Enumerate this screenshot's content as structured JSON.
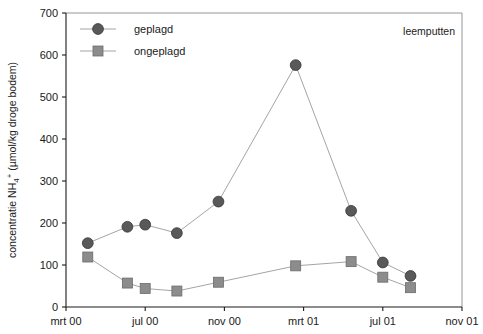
{
  "chart_data": {
    "type": "line",
    "title": "",
    "annotation": "leemputten",
    "xlabel": "",
    "ylabel": "concentratie NH4+ (µmol/kg droge bodem)",
    "ylabel_parts": {
      "prefix": "concentratie NH",
      "sub": "4",
      "sup": "+",
      "suffix": " (µmol/kg droge bodem)"
    },
    "ylim": [
      0,
      700
    ],
    "yticks": [
      0,
      100,
      200,
      300,
      400,
      500,
      600,
      700
    ],
    "ytick_labels": [
      "0",
      "100",
      "200",
      "300",
      "400",
      "500",
      "600",
      "700"
    ],
    "xtick_labels": [
      "mrt 00",
      "jul 00",
      "nov 00",
      "mrt 01",
      "jul 01",
      "nov 01"
    ],
    "xticks": [
      0,
      4,
      8,
      12,
      16,
      20
    ],
    "xlim": [
      0,
      20
    ],
    "grid": false,
    "legend_position": "top-left",
    "colors": {
      "geplagd_marker": "#595959",
      "ongeplagd_marker": "#8c8c8c",
      "line": "#9a9a9a",
      "axis": "#1a1a1a",
      "frame": "#8a8a8a",
      "background": "#ffffff"
    },
    "series": [
      {
        "name": "geplagd",
        "marker": "circle",
        "x": [
          1.1,
          3.1,
          4.0,
          5.6,
          7.7,
          11.6,
          14.4,
          16.0,
          17.4
        ],
        "values": [
          152,
          191,
          196,
          176,
          251,
          576,
          229,
          106,
          74
        ]
      },
      {
        "name": "ongeplagd",
        "marker": "square",
        "x": [
          1.1,
          3.1,
          4.0,
          5.6,
          7.7,
          11.6,
          14.4,
          16.0,
          17.4
        ],
        "values": [
          119,
          57,
          44,
          38,
          59,
          98,
          108,
          71,
          46
        ]
      }
    ]
  },
  "legend": {
    "items": [
      {
        "label": "geplagd",
        "marker": "circle"
      },
      {
        "label": "ongeplagd",
        "marker": "square"
      }
    ]
  }
}
